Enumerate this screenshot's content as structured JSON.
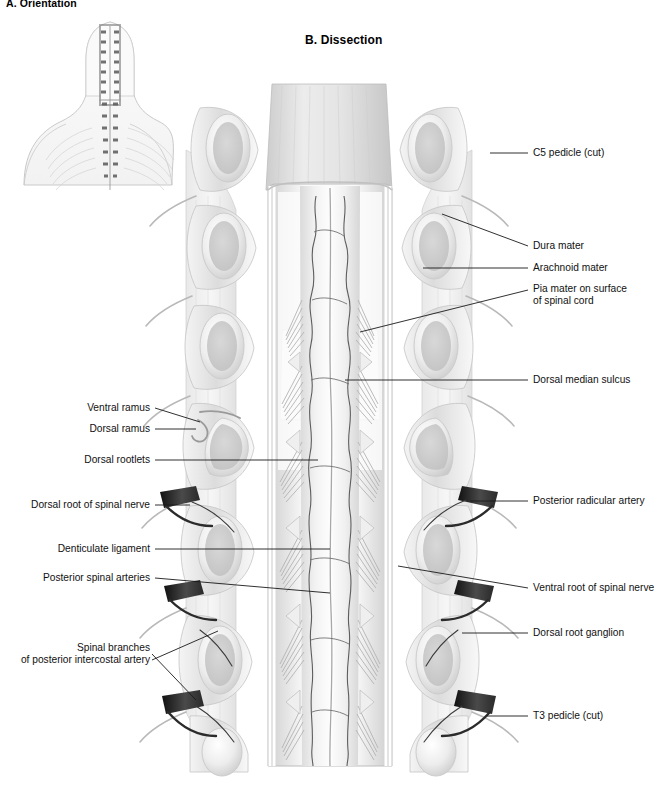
{
  "figure": {
    "panel_a_title": "A. Orientation",
    "panel_b_title": "B. Dissection",
    "background_color": "#ffffff",
    "ink_color": "#111111",
    "line_color": "#1a1a1a"
  },
  "orientation_inset": {
    "name": "posterior-torso-orientation-inset",
    "description": "small grayscale posterior view of head, neck, shoulders and thorax with vertebral canal opened showing spinal cord"
  },
  "labels_right": [
    {
      "text": "C5 pedicle (cut)",
      "x": 533,
      "y": 153,
      "leader": "M 490 153 L 528 153"
    },
    {
      "text": "Dura mater",
      "x": 533,
      "y": 246,
      "leader": "M 442 214 L 528 246"
    },
    {
      "text": "Arachnoid mater",
      "x": 533,
      "y": 268,
      "leader": "M 423 268 L 528 268"
    },
    {
      "text": "Pia mater on surface",
      "x": 533,
      "y": 289,
      "leader": "M 360 332 L 528 290"
    },
    {
      "text": "of spinal cord",
      "x": 533,
      "y": 301,
      "leader": ""
    },
    {
      "text": "Dorsal median sulcus",
      "x": 533,
      "y": 380,
      "leader": "M 345 380 L 528 380"
    },
    {
      "text": "Posterior radicular artery",
      "x": 533,
      "y": 501,
      "leader": "M 470 501 L 528 501"
    },
    {
      "text": "Ventral root of spinal nerve",
      "x": 533,
      "y": 588,
      "leader": "M 398 566 L 528 588"
    },
    {
      "text": "Dorsal root ganglion",
      "x": 533,
      "y": 633,
      "leader": "M 462 633 L 528 633"
    },
    {
      "text": "T3 pedicle (cut)",
      "x": 533,
      "y": 716,
      "leader": "M 487 716 L 528 716"
    }
  ],
  "labels_left": [
    {
      "text": "Ventral ramus",
      "x": 150,
      "y": 408,
      "leader": "M 155 408 L 200 422"
    },
    {
      "text": "Dorsal ramus",
      "x": 150,
      "y": 429,
      "leader": "M 155 429 L 196 429"
    },
    {
      "text": "Dorsal rootlets",
      "x": 150,
      "y": 460,
      "leader": "M 155 460 L 318 460"
    },
    {
      "text": "Dorsal root of spinal nerve",
      "x": 150,
      "y": 505,
      "leader": "M 155 505 L 190 505"
    },
    {
      "text": "Denticulate ligament",
      "x": 150,
      "y": 549,
      "leader": "M 155 549 L 330 549"
    },
    {
      "text": "Posterior spinal arteries",
      "x": 150,
      "y": 578,
      "leader": "M 155 578 L 330 593"
    },
    {
      "text": "Spinal branches",
      "x": 150,
      "y": 648,
      "leader": "M 152 654 L 196 700"
    },
    {
      "text": "of posterior intercostal artery",
      "x": 150,
      "y": 660,
      "leader": "M 152 660 L 218 631"
    }
  ],
  "anatomy": {
    "vertebral_levels": [
      "C5",
      "C6",
      "C7",
      "T1",
      "T2",
      "T3"
    ],
    "structures": [
      "cut pedicle",
      "vertebral arch",
      "dura mater flap",
      "arachnoid mater",
      "pia mater",
      "spinal cord",
      "dorsal median sulcus",
      "dorsal rootlets",
      "dorsal root of spinal nerve",
      "dorsal root ganglion",
      "ventral root of spinal nerve",
      "dorsal ramus",
      "ventral ramus",
      "denticulate ligament",
      "posterior spinal arteries",
      "posterior radicular artery",
      "spinal branches of posterior intercostal artery"
    ]
  }
}
